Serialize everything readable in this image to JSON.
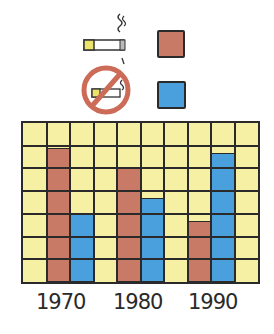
{
  "chart_data": {
    "type": "bar",
    "title": "",
    "categories": [
      "1970",
      "1980",
      "1990"
    ],
    "series": [
      {
        "name": "Smokers",
        "legend_icon": "lit-cigarette-icon",
        "color": "#c87a66",
        "values": [
          5.9,
          5.0,
          2.7
        ]
      },
      {
        "name": "Non-smokers",
        "legend_icon": "no-smoking-icon",
        "color": "#4aa0dc",
        "values": [
          3.0,
          3.7,
          5.7
        ]
      }
    ],
    "xlabel": "",
    "ylabel": "",
    "ylim": [
      0,
      7
    ],
    "grid": {
      "on": true,
      "rows": 7,
      "cols": 10,
      "background": "#f6f0a4"
    },
    "legend_position": "top"
  },
  "legend": {
    "items": [
      {
        "icon": "lit-cigarette-icon",
        "color": "#c87a66"
      },
      {
        "icon": "no-smoking-icon",
        "color": "#4aa0dc"
      }
    ]
  }
}
